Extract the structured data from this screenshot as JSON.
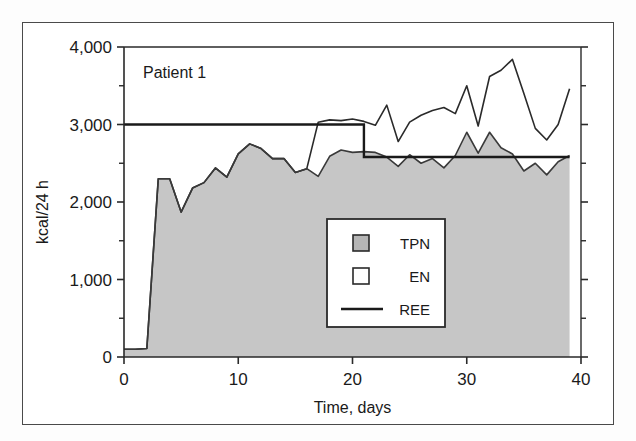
{
  "figure": {
    "panel_label": "Patient 1",
    "background_color": "#ffffff",
    "frame_color": "#4a4a4a"
  },
  "chart_data": {
    "type": "area",
    "title": "Patient 1",
    "xlabel": "Time, days",
    "ylabel": "kcal/24 h",
    "xlim": [
      0,
      40
    ],
    "ylim": [
      0,
      4000
    ],
    "xticks": [
      0,
      10,
      20,
      30,
      40
    ],
    "xtick_labels": [
      "0",
      "10",
      "20",
      "30",
      "40"
    ],
    "yticks": [
      0,
      1000,
      2000,
      3000,
      4000
    ],
    "ytick_labels": [
      "0",
      "1,000",
      "2,000",
      "3,000",
      "4,000"
    ],
    "minor_ytick_step": 500,
    "grid": false,
    "legend_position": "center-right-inside",
    "series": [
      {
        "name": "TPN",
        "style": "filled-area",
        "fill_color": "#c6c6c6",
        "line_color": "#3a3a3a",
        "x": [
          0,
          1,
          2,
          3,
          4,
          5,
          6,
          7,
          8,
          9,
          10,
          11,
          12,
          13,
          14,
          15,
          16,
          17,
          18,
          19,
          20,
          21,
          22,
          23,
          24,
          25,
          26,
          27,
          28,
          29,
          30,
          31,
          32,
          33,
          34,
          35,
          36,
          37,
          38,
          39
        ],
        "values": [
          100,
          100,
          110,
          2300,
          2300,
          1870,
          2180,
          2250,
          2440,
          2320,
          2620,
          2750,
          2690,
          2560,
          2560,
          2380,
          2430,
          2330,
          2590,
          2670,
          2640,
          2650,
          2640,
          2580,
          2460,
          2610,
          2500,
          2560,
          2440,
          2600,
          2900,
          2630,
          2900,
          2700,
          2620,
          2400,
          2500,
          2350,
          2520,
          2600
        ]
      },
      {
        "name": "EN",
        "style": "line-upper-boundary",
        "fill_color": "#ffffff",
        "line_color": "#2a2a2a",
        "x": [
          0,
          1,
          2,
          3,
          4,
          5,
          6,
          7,
          8,
          9,
          10,
          11,
          12,
          13,
          14,
          15,
          16,
          17,
          18,
          19,
          20,
          21,
          22,
          23,
          24,
          25,
          26,
          27,
          28,
          29,
          30,
          31,
          32,
          33,
          34,
          35,
          36,
          37,
          38,
          39
        ],
        "values": [
          100,
          100,
          110,
          2300,
          2300,
          1870,
          2180,
          2250,
          2440,
          2320,
          2620,
          2750,
          2690,
          2560,
          2560,
          2380,
          2430,
          3030,
          3060,
          3050,
          3070,
          3040,
          2990,
          3250,
          2780,
          3030,
          3120,
          3180,
          3220,
          3140,
          3500,
          2980,
          3620,
          3700,
          3840,
          3400,
          2950,
          2800,
          3000,
          3460
        ]
      },
      {
        "name": "REE",
        "style": "step-line",
        "line_color": "#1a1a1a",
        "x": [
          0,
          18,
          18,
          22,
          22,
          39
        ],
        "values": [
          3000,
          3000,
          3000,
          3000,
          2580,
          2580
        ],
        "segments": [
          {
            "x_start": 0,
            "x_end": 21,
            "y": 3000
          },
          {
            "x_start": 21,
            "x_end": 22,
            "y": 2580
          },
          {
            "x_start": 22,
            "x_end": 39,
            "y": 2580
          }
        ]
      }
    ],
    "legend": [
      {
        "label": "TPN",
        "marker": "square-filled",
        "color": "#b5b5b5"
      },
      {
        "label": "EN",
        "marker": "square-open",
        "color": "#ffffff"
      },
      {
        "label": "REE",
        "marker": "line",
        "color": "#1a1a1a"
      }
    ]
  }
}
